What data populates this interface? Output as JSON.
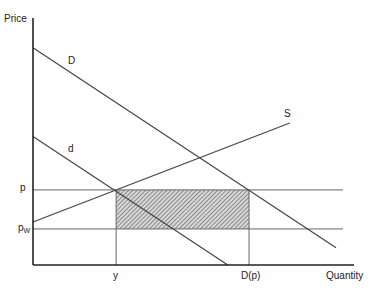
{
  "chart_data": {
    "type": "line",
    "title": "",
    "xlabel": "Quantity",
    "ylabel": "Price",
    "xlim": [
      0,
      100
    ],
    "ylim": [
      0,
      100
    ],
    "grid": false,
    "series": [
      {
        "name": "D",
        "label": "D",
        "points": [
          [
            0,
            88
          ],
          [
            94.4,
            7
          ]
        ]
      },
      {
        "name": "d",
        "label": "d",
        "points": [
          [
            0,
            52
          ],
          [
            60.7,
            0
          ]
        ]
      },
      {
        "name": "S",
        "label": "S",
        "points": [
          [
            0,
            17.4
          ],
          [
            80,
            57.5
          ]
        ]
      }
    ],
    "horizontal_lines": [
      {
        "name": "p",
        "label": "p",
        "y": 30.4
      },
      {
        "name": "pw",
        "label": "p",
        "subscript": "W",
        "y": 14.6
      }
    ],
    "vertical_markers": [
      {
        "name": "y",
        "label": "y",
        "x": 25.9
      },
      {
        "name": "D(p)",
        "label": "D(p)",
        "x": 67.3
      }
    ],
    "shaded_region": {
      "x": [
        25.9,
        67.3
      ],
      "y": [
        14.6,
        30.4
      ],
      "pattern": "hatched"
    }
  }
}
